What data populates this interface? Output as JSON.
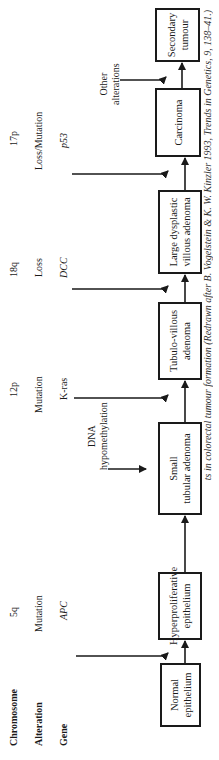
{
  "row_headers": {
    "chromosome": "Chromosome",
    "alteration": "Alteration",
    "gene": "Gene"
  },
  "events": [
    {
      "chromosome": "5q",
      "alteration": "Mutation",
      "gene": "APC"
    },
    {
      "chromosome": "12p",
      "alteration": "Mutation",
      "gene": "K-ras"
    },
    {
      "chromosome": "18q",
      "alteration": "Loss",
      "gene": "DCC"
    },
    {
      "chromosome": "17p",
      "alteration": "Loss/Mutation",
      "gene": "p53"
    }
  ],
  "side_inputs": {
    "dna": "DNA hypomethylation",
    "dna_line1": "DNA",
    "dna_line2": "hypomethylation",
    "other_line1": "Other",
    "other_line2": "alterations"
  },
  "stages": [
    {
      "line1": "Normal",
      "line2": "epithelium"
    },
    {
      "line1": "Hyperproliferative",
      "line2": "epithelium"
    },
    {
      "line1": "Small",
      "line2": "tubular adenoma"
    },
    {
      "line1": "Tubulo-villous",
      "line2": "adenoma"
    },
    {
      "line1": "Large dysplastic",
      "line2": "villous adenoma"
    },
    {
      "line1": "Carcinoma",
      "line2": ""
    },
    {
      "line1": "Secondary",
      "line2": "tumour"
    }
  ],
  "caption": "ts in colorectal tumour formation (Redrawn after B. Vogelstein & K. W. Kinzler 1993, Trends in Genetics, 9, 138–41.)",
  "colors": {
    "ink": "#1a1a1a",
    "background": "#ffffff"
  }
}
